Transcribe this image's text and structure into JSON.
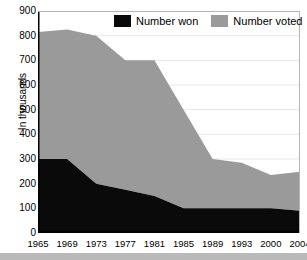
{
  "chart_data": {
    "type": "area",
    "stacked": true,
    "title": "",
    "subtitle": "",
    "xlabel": "",
    "ylabel": "In thousands",
    "categories": [
      "1965",
      "1969",
      "1973",
      "1977",
      "1981",
      "1985",
      "1989",
      "1993",
      "2000",
      "2004"
    ],
    "ylim": [
      0,
      900
    ],
    "ytick_step": 100,
    "yticks": [
      "900",
      "800",
      "700",
      "600",
      "500",
      "400",
      "300",
      "200",
      "100",
      "0"
    ],
    "grid": "horizontal",
    "legend_position": "top-center",
    "series": [
      {
        "name": "Number won",
        "color": "#0a0a0a",
        "values": [
          300,
          300,
          200,
          175,
          150,
          100,
          100,
          100,
          100,
          90
        ]
      },
      {
        "name": "Number voted",
        "color": "#9a9a9a",
        "values": [
          515,
          525,
          600,
          525,
          550,
          400,
          200,
          185,
          135,
          158
        ]
      }
    ],
    "totals": [
      815,
      825,
      800,
      700,
      700,
      500,
      300,
      285,
      235,
      248
    ],
    "annotations": []
  },
  "legend": {
    "items": [
      {
        "label": "Number won",
        "swatch": "black-swatch"
      },
      {
        "label": "Number voted",
        "swatch": "gray-swatch"
      }
    ]
  },
  "colors": {
    "number_won": "#0a0a0a",
    "number_voted": "#9a9a9a",
    "axis": "#000000",
    "gridline": "#e8e8e8",
    "background": "#ffffff",
    "bottom_band": "#b9b9b9"
  }
}
